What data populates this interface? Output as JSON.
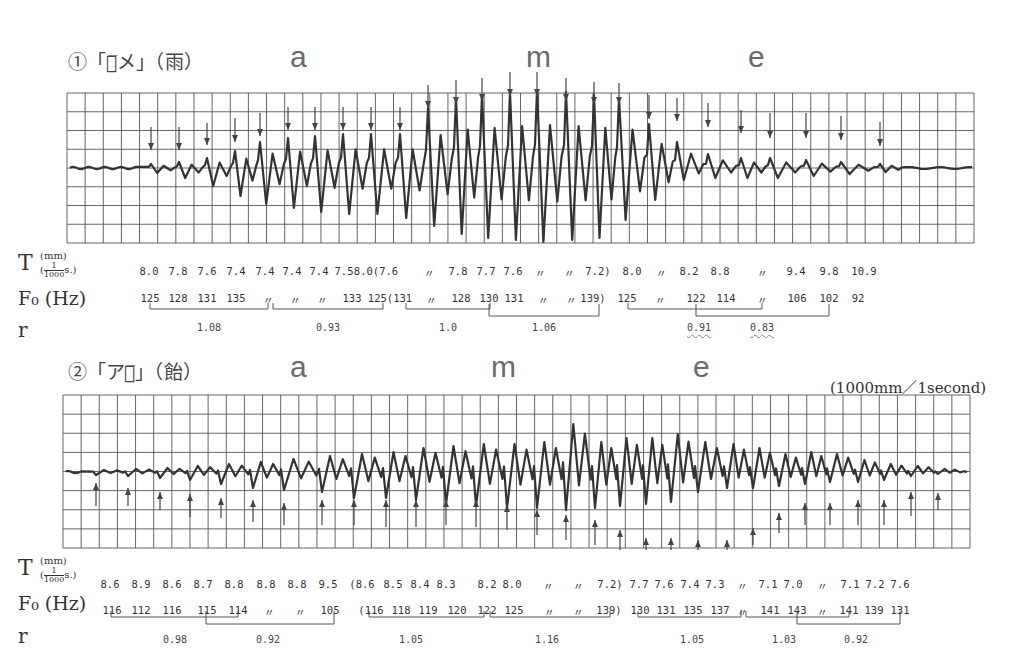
{
  "panels": [
    {
      "id": "ame-rain",
      "title": "①「ア̅メ」（雨）",
      "title_pos": [
        68,
        47
      ],
      "phonemes": [
        {
          "label": "a",
          "x": 300,
          "y": 40
        },
        {
          "label": "m",
          "x": 536,
          "y": 40
        },
        {
          "label": "e",
          "x": 758,
          "y": 40
        }
      ],
      "grid": {
        "left": 67,
        "top": 93,
        "right": 974,
        "bottom": 243,
        "cols": 50,
        "rows": 8
      },
      "arrow_dir": "down",
      "row_labels_y": {
        "T": 250,
        "F0": 287,
        "r": 318
      },
      "T_row_y": 265,
      "F0_row_y": 292,
      "r_row_y": 322,
      "T_values": [
        {
          "x": 149,
          "t": "8.0"
        },
        {
          "x": 178,
          "t": "7.8"
        },
        {
          "x": 207,
          "t": "7.6"
        },
        {
          "x": 236,
          "t": "7.4"
        },
        {
          "x": 265,
          "t": "7.4"
        },
        {
          "x": 292,
          "t": "7.4"
        },
        {
          "x": 319,
          "t": "7.4"
        },
        {
          "x": 344,
          "t": "7.5"
        },
        {
          "x": 376,
          "t": "8.0(7.6"
        },
        {
          "x": 429,
          "t": "〃"
        },
        {
          "x": 458,
          "t": "7.8"
        },
        {
          "x": 486,
          "t": "7.7"
        },
        {
          "x": 513,
          "t": "7.6"
        },
        {
          "x": 540,
          "t": "〃"
        },
        {
          "x": 569,
          "t": "〃"
        },
        {
          "x": 598,
          "t": "7.2)"
        },
        {
          "x": 632,
          "t": "8.0"
        },
        {
          "x": 661,
          "t": "〃"
        },
        {
          "x": 689,
          "t": "8.2"
        },
        {
          "x": 720,
          "t": "8.8"
        },
        {
          "x": 762,
          "t": "〃"
        },
        {
          "x": 796,
          "t": "9.4"
        },
        {
          "x": 829,
          "t": "9.8"
        },
        {
          "x": 864,
          "t": "10.9"
        }
      ],
      "F0_values": [
        {
          "x": 150,
          "t": "125"
        },
        {
          "x": 178,
          "t": "128"
        },
        {
          "x": 207,
          "t": "131"
        },
        {
          "x": 236,
          "t": "135"
        },
        {
          "x": 268,
          "t": "〃"
        },
        {
          "x": 295,
          "t": "〃"
        },
        {
          "x": 322,
          "t": "〃"
        },
        {
          "x": 352,
          "t": "133"
        },
        {
          "x": 390,
          "t": "125(131"
        },
        {
          "x": 431,
          "t": "〃"
        },
        {
          "x": 461,
          "t": "128"
        },
        {
          "x": 489,
          "t": "130"
        },
        {
          "x": 514,
          "t": "131"
        },
        {
          "x": 543,
          "t": "〃"
        },
        {
          "x": 571,
          "t": "〃"
        },
        {
          "x": 593,
          "t": "139)"
        },
        {
          "x": 627,
          "t": "125"
        },
        {
          "x": 660,
          "t": "〃"
        },
        {
          "x": 696,
          "t": "122"
        },
        {
          "x": 726,
          "t": "114"
        },
        {
          "x": 762,
          "t": "〃"
        },
        {
          "x": 797,
          "t": "106"
        },
        {
          "x": 829,
          "t": "102"
        },
        {
          "x": 858,
          "t": "92"
        }
      ],
      "brackets": [
        {
          "x1": 150,
          "x2": 268,
          "y": 309,
          "h": 6
        },
        {
          "x1": 273,
          "x2": 383,
          "y": 309,
          "h": 6
        },
        {
          "x1": 406,
          "x2": 490,
          "y": 309,
          "h": 6
        },
        {
          "x1": 489,
          "x2": 599,
          "y": 316,
          "h": 12
        },
        {
          "x1": 628,
          "x2": 762,
          "y": 309,
          "h": 6
        },
        {
          "x1": 696,
          "x2": 829,
          "y": 316,
          "h": 12
        }
      ],
      "r_values": [
        {
          "x": 209,
          "t": "1.08",
          "wavy": false
        },
        {
          "x": 328,
          "t": "0.93",
          "wavy": false
        },
        {
          "x": 448,
          "t": "1.0",
          "wavy": false
        },
        {
          "x": 544,
          "t": "1.06",
          "wavy": false
        },
        {
          "x": 699,
          "t": "0.91",
          "wavy": true
        },
        {
          "x": 762,
          "t": "0.83",
          "wavy": true
        }
      ]
    },
    {
      "id": "ame-candy",
      "title": "②「アメ̅」（飴）",
      "title_pos": [
        68,
        357
      ],
      "phonemes": [
        {
          "label": "a",
          "x": 300,
          "y": 350
        },
        {
          "label": "m",
          "x": 501,
          "y": 350
        },
        {
          "label": "e",
          "x": 703,
          "y": 350
        }
      ],
      "scale_label": "(1000mm／1second)",
      "scale_pos": [
        830,
        376
      ],
      "grid": {
        "left": 63,
        "top": 395,
        "right": 970,
        "bottom": 548,
        "cols": 50,
        "rows": 8
      },
      "arrow_dir": "up",
      "row_labels_y": {
        "T": 555,
        "F0": 592,
        "r": 624
      },
      "T_row_y": 578,
      "F0_row_y": 604,
      "r_row_y": 634,
      "T_values": [
        {
          "x": 110,
          "t": "8.6"
        },
        {
          "x": 141,
          "t": "8.9"
        },
        {
          "x": 172,
          "t": "8.6"
        },
        {
          "x": 203,
          "t": "8.7"
        },
        {
          "x": 234,
          "t": "8.8"
        },
        {
          "x": 266,
          "t": "8.8"
        },
        {
          "x": 297,
          "t": "8.8"
        },
        {
          "x": 328,
          "t": "9.5"
        },
        {
          "x": 362,
          "t": "(8.6"
        },
        {
          "x": 393,
          "t": "8.5"
        },
        {
          "x": 420,
          "t": "8.4"
        },
        {
          "x": 446,
          "t": "8.3"
        },
        {
          "x": 487,
          "t": "8.2"
        },
        {
          "x": 512,
          "t": "8.0"
        },
        {
          "x": 548,
          "t": "〃"
        },
        {
          "x": 578,
          "t": "〃"
        },
        {
          "x": 610,
          "t": "7.2)"
        },
        {
          "x": 639,
          "t": "7.7"
        },
        {
          "x": 664,
          "t": "7.6"
        },
        {
          "x": 690,
          "t": "7.4"
        },
        {
          "x": 715,
          "t": "7.3"
        },
        {
          "x": 742,
          "t": "〃"
        },
        {
          "x": 768,
          "t": "7.1"
        },
        {
          "x": 793,
          "t": "7.0"
        },
        {
          "x": 822,
          "t": "〃"
        },
        {
          "x": 850,
          "t": "7.1"
        },
        {
          "x": 875,
          "t": "7.2"
        },
        {
          "x": 900,
          "t": "7.6"
        }
      ],
      "F0_values": [
        {
          "x": 112,
          "t": "116"
        },
        {
          "x": 141,
          "t": "112"
        },
        {
          "x": 172,
          "t": "116"
        },
        {
          "x": 207,
          "t": "115"
        },
        {
          "x": 238,
          "t": "114"
        },
        {
          "x": 269,
          "t": "〃"
        },
        {
          "x": 300,
          "t": "〃"
        },
        {
          "x": 330,
          "t": "105"
        },
        {
          "x": 371,
          "t": "(116"
        },
        {
          "x": 401,
          "t": "118"
        },
        {
          "x": 428,
          "t": "119"
        },
        {
          "x": 457,
          "t": "120"
        },
        {
          "x": 487,
          "t": "122"
        },
        {
          "x": 514,
          "t": "125"
        },
        {
          "x": 549,
          "t": "〃"
        },
        {
          "x": 578,
          "t": "〃"
        },
        {
          "x": 609,
          "t": "139)"
        },
        {
          "x": 640,
          "t": "130"
        },
        {
          "x": 666,
          "t": "131"
        },
        {
          "x": 693,
          "t": "135"
        },
        {
          "x": 720,
          "t": "137"
        },
        {
          "x": 742,
          "t": "〃"
        },
        {
          "x": 770,
          "t": "141"
        },
        {
          "x": 797,
          "t": "143"
        },
        {
          "x": 822,
          "t": "〃"
        },
        {
          "x": 849,
          "t": "141"
        },
        {
          "x": 874,
          "t": "139"
        },
        {
          "x": 900,
          "t": "131"
        }
      ],
      "brackets": [
        {
          "x1": 111,
          "x2": 238,
          "y": 617,
          "h": 6
        },
        {
          "x1": 206,
          "x2": 334,
          "y": 624,
          "h": 13
        },
        {
          "x1": 369,
          "x2": 484,
          "y": 617,
          "h": 6
        },
        {
          "x1": 490,
          "x2": 610,
          "y": 617,
          "h": 6
        },
        {
          "x1": 638,
          "x2": 741,
          "y": 617,
          "h": 6
        },
        {
          "x1": 746,
          "x2": 849,
          "y": 617,
          "h": 6
        },
        {
          "x1": 797,
          "x2": 900,
          "y": 624,
          "h": 13
        }
      ],
      "r_values": [
        {
          "x": 175,
          "t": "0.98",
          "wavy": false
        },
        {
          "x": 268,
          "t": "0.92",
          "wavy": false
        },
        {
          "x": 411,
          "t": "1.05",
          "wavy": false
        },
        {
          "x": 547,
          "t": "1.16",
          "wavy": false
        },
        {
          "x": 692,
          "t": "1.05",
          "wavy": false
        },
        {
          "x": 784,
          "t": "1.03",
          "wavy": false
        },
        {
          "x": 856,
          "t": "0.92",
          "wavy": false
        }
      ]
    }
  ],
  "row_labels": {
    "T": "T",
    "T_unit_top": "(mm)",
    "T_unit_bottom": "s.)",
    "T_frac_num": "1",
    "T_frac_den": "1000",
    "F0": "F₀ (Hz)",
    "r": "r"
  },
  "chart_data": [
    {
      "type": "line",
      "title": "①「ア̅メ」（雨） ame (rain) — speech waveform",
      "xlabel": "time (1000mm/1second)",
      "ylabel": "amplitude",
      "grid": true,
      "phoneme_segments": [
        "a",
        "m",
        "e"
      ],
      "series": [
        {
          "name": "T (mm = 1/1000 s)",
          "values": [
            8.0,
            7.8,
            7.6,
            7.4,
            7.4,
            7.4,
            7.4,
            7.5,
            8.0,
            7.6,
            7.6,
            7.8,
            7.7,
            7.6,
            7.6,
            7.6,
            7.2,
            8.0,
            8.0,
            8.2,
            8.8,
            8.8,
            9.4,
            9.8,
            10.9
          ]
        },
        {
          "name": "F0 (Hz)",
          "values": [
            125,
            128,
            131,
            135,
            135,
            135,
            135,
            133,
            125,
            131,
            131,
            128,
            130,
            131,
            131,
            131,
            139,
            125,
            125,
            122,
            114,
            114,
            106,
            102,
            92
          ]
        }
      ],
      "ratios_r": [
        1.08,
        0.93,
        1.0,
        1.06,
        0.91,
        0.83
      ],
      "annotations": [
        "〃 = ditto (same as previous)",
        "wavy underline on 0.91 and 0.83"
      ]
    },
    {
      "type": "line",
      "title": "②「アメ̅」（飴） ame (candy) — speech waveform",
      "xlabel": "time (1000mm/1second)",
      "ylabel": "amplitude",
      "grid": true,
      "phoneme_segments": [
        "a",
        "m",
        "e"
      ],
      "series": [
        {
          "name": "T (mm = 1/1000 s)",
          "values": [
            8.6,
            8.9,
            8.6,
            8.7,
            8.8,
            8.8,
            8.8,
            9.5,
            8.6,
            8.5,
            8.4,
            8.3,
            8.2,
            8.0,
            8.0,
            8.0,
            7.2,
            7.7,
            7.6,
            7.4,
            7.3,
            7.3,
            7.1,
            7.0,
            7.0,
            7.1,
            7.2,
            7.6
          ]
        },
        {
          "name": "F0 (Hz)",
          "values": [
            116,
            112,
            116,
            115,
            114,
            114,
            114,
            105,
            116,
            118,
            119,
            120,
            122,
            125,
            125,
            125,
            139,
            130,
            131,
            135,
            137,
            137,
            141,
            143,
            143,
            141,
            139,
            131
          ]
        }
      ],
      "ratios_r": [
        0.98,
        0.92,
        1.05,
        1.16,
        1.05,
        1.03,
        0.92
      ]
    }
  ],
  "waves": [
    {
      "baseline": 168,
      "arrow_xs": [
        151,
        179,
        207,
        235,
        260,
        288,
        315,
        343,
        371,
        400,
        428,
        456,
        482,
        510,
        537,
        566,
        594,
        619,
        649,
        677,
        708,
        741,
        770,
        806,
        841,
        880
      ],
      "arrow_top": [
        127,
        127,
        123,
        118,
        113,
        107,
        107,
        107,
        107,
        107,
        85,
        80,
        78,
        72,
        72,
        78,
        82,
        83,
        95,
        98,
        103,
        110,
        113,
        113,
        116,
        122
      ],
      "arrow_bot": [
        150,
        150,
        145,
        142,
        136,
        130,
        130,
        130,
        130,
        130,
        108,
        104,
        101,
        96,
        96,
        101,
        104,
        104,
        119,
        121,
        127,
        133,
        138,
        138,
        140,
        146
      ],
      "peaks": [
        4,
        6,
        10,
        17,
        26,
        30,
        32,
        34,
        34,
        34,
        60,
        70,
        73,
        76,
        78,
        76,
        73,
        70,
        44,
        26,
        14,
        10,
        10,
        8,
        6,
        4
      ],
      "troughs": [
        5,
        10,
        18,
        28,
        36,
        40,
        44,
        46,
        46,
        50,
        58,
        66,
        70,
        72,
        74,
        72,
        70,
        52,
        32,
        12,
        10,
        10,
        10,
        8,
        6,
        4
      ],
      "start_x": 70,
      "end_x": 972
    },
    {
      "baseline": 472,
      "arrow_xs": [
        96,
        128,
        160,
        190,
        221,
        253,
        284,
        322,
        354,
        386,
        416,
        446,
        476,
        507,
        537,
        566,
        595,
        620,
        646,
        671,
        698,
        727,
        753,
        779,
        805,
        830,
        858,
        884,
        911,
        938
      ],
      "arrow_top": [
        483,
        488,
        492,
        494,
        498,
        500,
        503,
        500,
        500,
        500,
        500,
        500,
        500,
        505,
        510,
        515,
        520,
        530,
        538,
        538,
        540,
        540,
        528,
        513,
        503,
        503,
        500,
        500,
        492,
        493
      ],
      "arrow_bot": [
        506,
        506,
        510,
        517,
        518,
        522,
        525,
        525,
        525,
        527,
        527,
        525,
        527,
        530,
        535,
        540,
        545,
        550,
        550,
        550,
        550,
        550,
        545,
        533,
        525,
        525,
        525,
        525,
        516,
        510
      ],
      "peaks": [
        2,
        3,
        4,
        6,
        8,
        10,
        13,
        16,
        18,
        20,
        24,
        26,
        28,
        28,
        30,
        48,
        30,
        34,
        34,
        38,
        30,
        28,
        24,
        18,
        20,
        18,
        12,
        8,
        6,
        3
      ],
      "troughs": [
        3,
        4,
        6,
        8,
        12,
        16,
        18,
        20,
        26,
        26,
        28,
        32,
        34,
        36,
        36,
        38,
        36,
        34,
        32,
        30,
        20,
        16,
        16,
        14,
        12,
        10,
        10,
        8,
        4,
        2
      ],
      "start_x": 66,
      "end_x": 968
    }
  ]
}
